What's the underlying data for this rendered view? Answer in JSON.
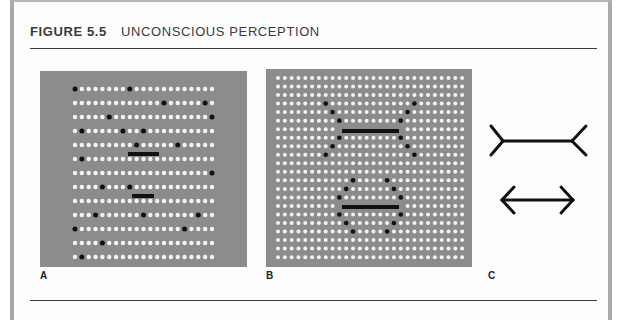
{
  "figure": {
    "number": "FIGURE 5.5",
    "title": "UNCONSCIOUS PERCEPTION"
  },
  "colors": {
    "panel_bg": "#8c8c8c",
    "dot_white": "#f4f4f4",
    "dot_black": "#111111",
    "line": "#111111",
    "frame": "#a9a9a9"
  },
  "panels": [
    {
      "label": "A",
      "box": {
        "x": 40,
        "y": 71,
        "w": 207,
        "h": 196
      },
      "grid": {
        "cols": 21,
        "rows": 13,
        "x0": 75,
        "y0": 89,
        "dx": 6.85,
        "dy": 14,
        "r": 2.2
      },
      "black_dots": [
        [
          0,
          0
        ],
        [
          0,
          8
        ],
        [
          1,
          13
        ],
        [
          1,
          19
        ],
        [
          2,
          5
        ],
        [
          2,
          20
        ],
        [
          3,
          1
        ],
        [
          3,
          7
        ],
        [
          3,
          10
        ],
        [
          4,
          9
        ],
        [
          4,
          15
        ],
        [
          5,
          1
        ],
        [
          6,
          20
        ],
        [
          7,
          4
        ],
        [
          7,
          8
        ],
        [
          9,
          3
        ],
        [
          9,
          10
        ],
        [
          9,
          18
        ],
        [
          10,
          0
        ],
        [
          10,
          16
        ],
        [
          11,
          4
        ],
        [
          12,
          1
        ]
      ],
      "bars": [
        {
          "x1": 128,
          "x2": 159,
          "y": 152,
          "h": 4
        },
        {
          "x1": 132,
          "x2": 154,
          "y": 194,
          "h": 4
        }
      ]
    },
    {
      "label": "B",
      "box": {
        "x": 266,
        "y": 69,
        "w": 206,
        "h": 198
      },
      "grid": {
        "cols": 28,
        "rows": 22,
        "x0": 278,
        "y0": 78,
        "dx": 6.82,
        "dy": 8.53,
        "r": 2.0
      },
      "black_dots": [
        [
          3,
          7
        ],
        [
          3,
          20
        ],
        [
          4,
          8
        ],
        [
          4,
          19
        ],
        [
          5,
          9
        ],
        [
          5,
          18
        ],
        [
          7,
          9
        ],
        [
          7,
          18
        ],
        [
          8,
          8
        ],
        [
          8,
          19
        ],
        [
          9,
          7
        ],
        [
          9,
          20
        ],
        [
          12,
          11
        ],
        [
          12,
          16
        ],
        [
          13,
          10
        ],
        [
          13,
          17
        ],
        [
          14,
          9
        ],
        [
          14,
          18
        ],
        [
          16,
          9
        ],
        [
          16,
          18
        ],
        [
          17,
          10
        ],
        [
          17,
          17
        ],
        [
          18,
          11
        ],
        [
          18,
          16
        ]
      ],
      "bar_rows": [
        6,
        15
      ],
      "bars": [
        {
          "x1": 342,
          "x2": 399,
          "y": 129,
          "h": 4
        },
        {
          "x1": 342,
          "x2": 399,
          "y": 205,
          "h": 4
        }
      ]
    },
    {
      "label": "C",
      "figures": [
        {
          "name": "fins-out",
          "shaft": {
            "x1": 503,
            "x2": 572,
            "y": 141
          },
          "lines": [
            [
              503,
              141,
              491,
              126
            ],
            [
              503,
              141,
              491,
              155
            ],
            [
              572,
              141,
              586,
              126
            ],
            [
              572,
              141,
              586,
              155
            ]
          ]
        },
        {
          "name": "arrows-in",
          "shaft": {
            "x1": 502,
            "x2": 573,
            "y": 200
          },
          "lines": [
            [
              502,
              200,
              514,
              187
            ],
            [
              502,
              200,
              514,
              213
            ],
            [
              573,
              200,
              561,
              187
            ],
            [
              573,
              200,
              561,
              213
            ]
          ]
        }
      ]
    }
  ],
  "labels": {
    "a": "A",
    "b": "B",
    "c": "C"
  }
}
